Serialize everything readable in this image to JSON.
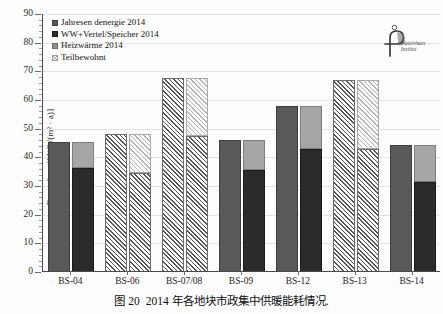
{
  "figure": {
    "caption_number": "图 20",
    "caption_text": "2014 年各地块市政集中供暖能耗情况."
  },
  "logo": {
    "name": "Passivhaus Institut",
    "line1": "Passivhaus",
    "line2": "Institut"
  },
  "chart_data": {
    "type": "bar",
    "title": "",
    "xlabel": "",
    "ylabel": "Fernwärme[kWh/(m² · a)]",
    "ylim": [
      0,
      90
    ],
    "ytick_step": 10,
    "yticks": [
      0,
      10,
      20,
      30,
      40,
      50,
      60,
      70,
      80,
      90
    ],
    "grid": true,
    "legend_position": "top-left",
    "legend": [
      {
        "label": "Jahresen denergie 2014",
        "style": "solid-mid"
      },
      {
        "label": "WW+Vertel/Speicher 2014",
        "style": "solid-dark"
      },
      {
        "label": "Heizwärme 2014",
        "style": "solid-light"
      },
      {
        "label": "Teilbewohnt",
        "style": "hatch-light"
      }
    ],
    "categories": [
      "BS-04",
      "BS-06",
      "BS-07/08",
      "BS-09",
      "BS-12",
      "BS-13",
      "BS-14"
    ],
    "groups": [
      {
        "category": "BS-04",
        "teilbewohnt": false,
        "left_bar": {
          "series": "Jahresen denergie 2014",
          "value": 45.2
        },
        "right_bar": {
          "total": 45.2,
          "segments": [
            {
              "series": "WW+Vertel/Speicher 2014",
              "value": 36.2
            },
            {
              "series": "Heizwärme 2014",
              "value": 9.0
            }
          ]
        }
      },
      {
        "category": "BS-06",
        "teilbewohnt": true,
        "left_bar": {
          "series": "Jahresen denergie 2014",
          "value": 48.2
        },
        "right_bar": {
          "total": 48.2,
          "segments": [
            {
              "series": "WW+Vertel/Speicher 2014",
              "value": 34.5
            },
            {
              "series": "Heizwärme 2014",
              "value": 13.7
            }
          ]
        }
      },
      {
        "category": "BS-07/08",
        "teilbewohnt": true,
        "left_bar": {
          "series": "Jahresen denergie 2014",
          "value": 67.6
        },
        "right_bar": {
          "total": 67.6,
          "segments": [
            {
              "series": "WW+Vertel/Speicher 2014",
              "value": 47.5
            },
            {
              "series": "Heizwärme 2014",
              "value": 20.1
            }
          ]
        }
      },
      {
        "category": "BS-09",
        "teilbewohnt": false,
        "left_bar": {
          "series": "Jahresen denergie 2014",
          "value": 46.0
        },
        "right_bar": {
          "total": 46.0,
          "segments": [
            {
              "series": "WW+Vertel/Speicher 2014",
              "value": 35.7
            },
            {
              "series": "Heizwärme 2014",
              "value": 10.3
            }
          ]
        }
      },
      {
        "category": "BS-12",
        "teilbewohnt": false,
        "left_bar": {
          "series": "Jahresen denergie 2014",
          "value": 58.0
        },
        "right_bar": {
          "total": 58.0,
          "segments": [
            {
              "series": "WW+Vertel/Speicher 2014",
              "value": 43.0
            },
            {
              "series": "Heizwärme 2014",
              "value": 15.0
            }
          ]
        }
      },
      {
        "category": "BS-13",
        "teilbewohnt": true,
        "left_bar": {
          "series": "Jahresen denergie 2014",
          "value": 67.0
        },
        "right_bar": {
          "total": 67.0,
          "segments": [
            {
              "series": "WW+Vertel/Speicher 2014",
              "value": 43.0
            },
            {
              "series": "Heizwärme 2014",
              "value": 24.0
            }
          ]
        }
      },
      {
        "category": "BS-14",
        "teilbewohnt": false,
        "left_bar": {
          "series": "Jahresen denergie 2014",
          "value": 44.2
        },
        "right_bar": {
          "total": 44.2,
          "segments": [
            {
              "series": "WW+Vertel/Speicher 2014",
              "value": 31.5
            },
            {
              "series": "Heizwärme 2014",
              "value": 12.7
            }
          ]
        }
      }
    ],
    "colors": {
      "solid_mid": "#595959",
      "solid_dark": "#2b2b2b",
      "solid_light": "#a6a6a6",
      "hatch": "#8e8e8e",
      "axis": "#4a4a4a",
      "grid": "#e2e2e2",
      "background": "#ffffff"
    }
  }
}
